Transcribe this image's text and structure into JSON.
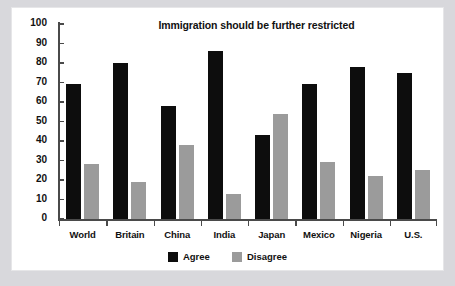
{
  "chart_data": {
    "type": "bar",
    "title": "Immigration should be further restricted",
    "xlabel": "",
    "ylabel": "",
    "ylim": [
      0,
      100
    ],
    "yticks": [
      0,
      10,
      20,
      30,
      40,
      50,
      60,
      70,
      80,
      90,
      100
    ],
    "grid": false,
    "legend_position": "bottom-center",
    "categories": [
      "World",
      "Britain",
      "China",
      "India",
      "Japan",
      "Mexico",
      "Nigeria",
      "U.S."
    ],
    "series": [
      {
        "name": "Agree",
        "color": "#0d0d0d",
        "values": [
          69,
          80,
          58,
          86,
          43,
          69,
          78,
          75
        ]
      },
      {
        "name": "Disagree",
        "color": "#9b9b9b",
        "values": [
          28,
          19,
          38,
          13,
          54,
          29,
          22,
          25
        ]
      }
    ]
  },
  "colors": {
    "agree": "#0d0d0d",
    "disagree": "#9b9b9b",
    "axis": "#4a4a4a",
    "panel_background": "#ffffff",
    "page_background": "#d8d8dc",
    "text": "#111111"
  }
}
